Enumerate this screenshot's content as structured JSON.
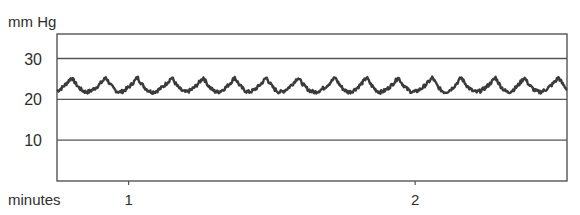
{
  "chart_data": {
    "type": "line",
    "title": "",
    "ylabel": "mm Hg",
    "xlabel": "minutes",
    "ylim": [
      0,
      36
    ],
    "xlim": [
      0.75,
      2.53
    ],
    "yticks": [
      10,
      20,
      30
    ],
    "ytick_labels": [
      "10",
      "20",
      "30"
    ],
    "xticks": [
      1,
      2
    ],
    "xtick_labels": [
      "1",
      "2"
    ],
    "grid": true,
    "legend": "none",
    "series": [
      {
        "name": "pressure",
        "color": "#3a3a3a",
        "baseline": 22.2,
        "peak": 25.5,
        "trough": 21.8,
        "cycle_minutes": 0.112,
        "first_peak_minute": 0.8,
        "peak_minutes": [
          0.8,
          0.92,
          1.03,
          1.15,
          1.26,
          1.37,
          1.48,
          1.59,
          1.72,
          1.83,
          1.94,
          2.06,
          2.16,
          2.28,
          2.38,
          2.5
        ]
      }
    ]
  }
}
